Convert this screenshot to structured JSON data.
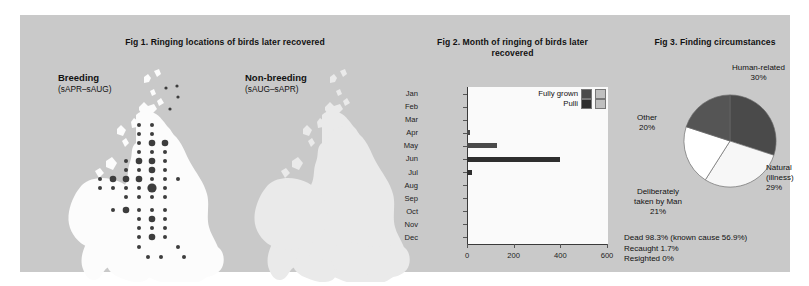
{
  "figure1": {
    "title": "Fig 1. Ringing locations of birds later recovered",
    "maps": [
      {
        "name": "breeding",
        "label": "Breeding",
        "season": "(sAPR–sAUG)",
        "has_dots": true
      },
      {
        "name": "non-breeding",
        "label": "Non-breeding",
        "season": "(sAUG–sAPR)",
        "has_dots": false
      }
    ]
  },
  "figure2": {
    "title": "Fig 2. Month of ringing of birds later recovered",
    "legend": [
      {
        "label": "Fully grown",
        "dark": "#4a4a4a",
        "light": "#bfbfbf"
      },
      {
        "label": "Pulli",
        "dark": "#2e2e2e",
        "light": "#bfbfbf"
      }
    ]
  },
  "figure3": {
    "title": "Fig 3. Finding circumstances",
    "labels": [
      {
        "name": "human-related",
        "text": "Human-related",
        "pct": "30%"
      },
      {
        "name": "natural",
        "text": "Natural\n(illness)",
        "pct": "29%"
      },
      {
        "name": "deliberately-taken",
        "text": "Deliberately\ntaken by Man",
        "pct": "21%"
      },
      {
        "name": "other",
        "text": "Other",
        "pct": "20%"
      }
    ],
    "fate_lines": [
      "Dead 98.3% (known cause 56.9%)",
      "Recaught 1.7%",
      "Resighted 0%"
    ]
  },
  "chart_data": [
    {
      "type": "bar",
      "id": "fig2-month-of-ringing",
      "title": "Fig 2. Month of ringing of birds later recovered",
      "orientation": "horizontal",
      "xlabel": "",
      "ylabel": "",
      "xlim": [
        0,
        600
      ],
      "xticks": [
        0,
        200,
        400,
        600
      ],
      "grid": false,
      "legend_position": "top-right",
      "categories": [
        "Jan",
        "Feb",
        "Mar",
        "Apr",
        "May",
        "Jun",
        "Jul",
        "Aug",
        "Sep",
        "Oct",
        "Nov",
        "Dec"
      ],
      "series": [
        {
          "name": "Fully grown",
          "color": "#4a4a4a",
          "values": [
            0,
            0,
            0,
            12,
            130,
            0,
            0,
            0,
            0,
            0,
            0,
            0
          ]
        },
        {
          "name": "Pulli",
          "color": "#2e2e2e",
          "values": [
            0,
            0,
            0,
            0,
            0,
            400,
            22,
            0,
            0,
            0,
            0,
            0
          ]
        }
      ]
    },
    {
      "type": "pie",
      "id": "fig3-finding-circumstances",
      "title": "Fig 3. Finding circumstances",
      "labels": [
        "Human-related",
        "Natural (illness)",
        "Deliberately taken by Man",
        "Other"
      ],
      "values": [
        30,
        29,
        21,
        20
      ],
      "unit": "%",
      "colors": [
        "#4a4a4a",
        "#f7f7f7",
        "#ffffff",
        "#555555"
      ]
    }
  ]
}
